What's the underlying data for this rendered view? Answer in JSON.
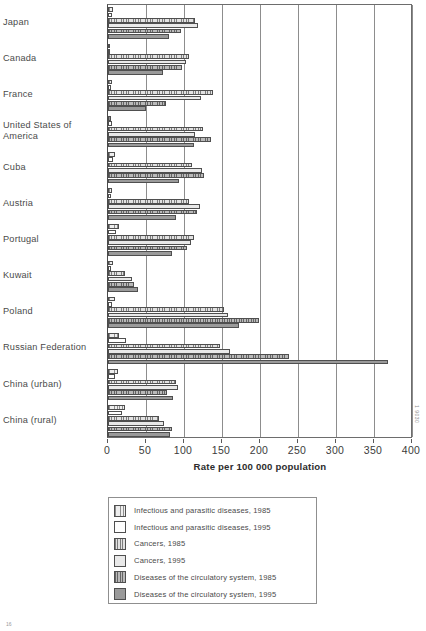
{
  "chart_data": {
    "type": "bar",
    "orientation": "horizontal",
    "title": "",
    "xlabel": "Rate per 100 000 population",
    "ylabel": "",
    "xlim": [
      0,
      400
    ],
    "xticks": [
      0,
      50,
      100,
      150,
      200,
      250,
      300,
      350,
      400
    ],
    "grid": true,
    "legend_position": "bottom",
    "categories": [
      "Japan",
      "Canada",
      "France",
      "United States of\nAmerica",
      "Cuba",
      "Austria",
      "Portugal",
      "Kuwait",
      "Poland",
      "Russian Federation",
      "China (urban)",
      "China (rural)"
    ],
    "series": [
      {
        "name": "Infectious and parasitic diseases, 1985",
        "values": [
          7,
          3,
          5,
          4,
          9,
          5,
          14,
          6,
          9,
          15,
          13,
          22
        ]
      },
      {
        "name": "Infectious and parasitic diseases, 1995",
        "values": [
          5,
          2,
          4,
          5,
          7,
          4,
          10,
          4,
          5,
          24,
          9,
          18
        ]
      },
      {
        "name": "Cancers, 1985",
        "values": [
          115,
          106,
          138,
          125,
          110,
          107,
          113,
          22,
          152,
          147,
          89,
          67
        ]
      },
      {
        "name": "Cancers, 1995",
        "values": [
          118,
          102,
          122,
          114,
          124,
          121,
          109,
          31,
          158,
          160,
          92,
          74
        ]
      },
      {
        "name": "Diseases of the circulatory system, 1985",
        "values": [
          96,
          98,
          76,
          135,
          126,
          117,
          104,
          34,
          199,
          238,
          77,
          84
        ]
      },
      {
        "name": "Diseases of the circulatory system, 1995",
        "values": [
          80,
          72,
          50,
          113,
          93,
          90,
          84,
          40,
          173,
          368,
          85,
          81
        ]
      }
    ],
    "series_styles": [
      "s0",
      "s1",
      "s2",
      "s3",
      "s4",
      "s5"
    ],
    "side_code": "1 9030"
  },
  "legend": {
    "items": [
      {
        "label": "Infectious and parasitic diseases, 1985",
        "style": "s0"
      },
      {
        "label": "Infectious and parasitic diseases, 1995",
        "style": "s1"
      },
      {
        "label": "Cancers, 1985",
        "style": "s2"
      },
      {
        "label": "Cancers, 1995",
        "style": "s3"
      },
      {
        "label": "Diseases of the circulatory system, 1985",
        "style": "s4"
      },
      {
        "label": "Diseases of the circulatory system, 1995",
        "style": "s5"
      }
    ]
  },
  "page": {
    "corner_code": "16"
  }
}
